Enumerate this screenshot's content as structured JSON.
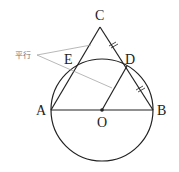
{
  "diagram": {
    "points": {
      "A": {
        "label": "A"
      },
      "B": {
        "label": "B"
      },
      "C": {
        "label": "C"
      },
      "D": {
        "label": "D"
      },
      "E": {
        "label": "E"
      },
      "O": {
        "label": "O"
      }
    },
    "annotation": {
      "label": "平行"
    },
    "colors": {
      "stroke": "#222222",
      "annotation": "#999999"
    }
  }
}
